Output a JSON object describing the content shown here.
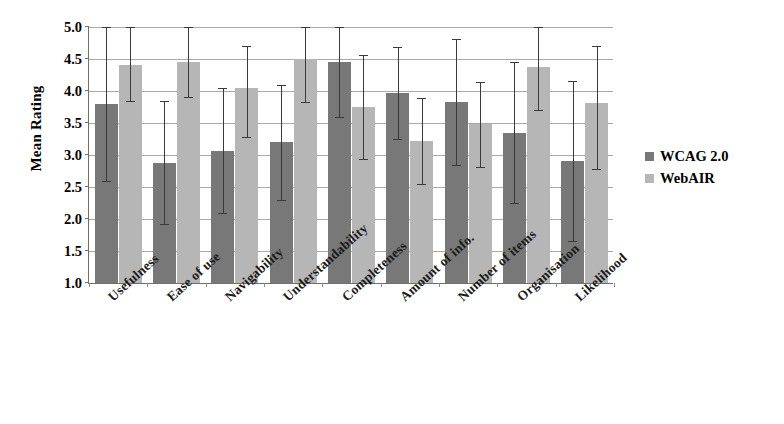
{
  "chart_data": {
    "type": "bar",
    "title": "",
    "xlabel": "",
    "ylabel": "Mean Rating",
    "ylim": [
      1.0,
      5.0
    ],
    "ytick_step": 0.5,
    "ytick_labels": [
      "5.0",
      "4.5",
      "4.0",
      "3.5",
      "3.0",
      "2.5",
      "2.0",
      "1.5",
      "1.0"
    ],
    "grid": true,
    "legend_position": "right",
    "error_bars": "standard deviation",
    "categories": [
      "Usefulness",
      "Ease of use",
      "Navigability",
      "Understandability",
      "Completeness",
      "Amount of info.",
      "Number of items",
      "Organisation",
      "Likelihood"
    ],
    "series": [
      {
        "name": "WCAG 2.0",
        "color": "#787878",
        "values": [
          3.8,
          2.88,
          3.07,
          3.2,
          4.45,
          3.97,
          3.83,
          3.35,
          2.9
        ],
        "err_low": [
          2.6,
          1.92,
          2.1,
          2.3,
          3.6,
          3.25,
          2.85,
          2.25,
          1.65
        ],
        "err_high": [
          5.0,
          3.84,
          4.04,
          4.1,
          5.0,
          4.69,
          4.81,
          4.45,
          4.15
        ]
      },
      {
        "name": "WebAIR",
        "color": "#b6b6b6",
        "values": [
          4.4,
          4.45,
          4.05,
          4.5,
          3.75,
          3.22,
          3.48,
          4.38,
          3.82
        ],
        "err_low": [
          3.85,
          3.9,
          3.28,
          3.83,
          2.93,
          2.55,
          2.82,
          3.7,
          2.78
        ],
        "err_high": [
          5.0,
          5.0,
          4.7,
          5.0,
          4.57,
          3.89,
          4.14,
          5.0,
          4.7
        ]
      }
    ]
  },
  "legend": {
    "items": [
      {
        "label": "WCAG 2.0",
        "color": "#787878"
      },
      {
        "label": "WebAIR",
        "color": "#b6b6b6"
      }
    ]
  },
  "axis": {
    "y_title": "Mean Rating"
  }
}
